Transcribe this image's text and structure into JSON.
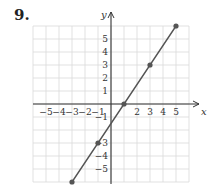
{
  "problem": {
    "number": "9."
  },
  "chart_data": {
    "type": "line",
    "title": "",
    "xlabel": "x",
    "ylabel": "y",
    "xlim": [
      -6,
      6
    ],
    "ylim": [
      -6,
      6
    ],
    "grid": true,
    "x_ticks": [
      -5,
      -4,
      -3,
      -2,
      -1,
      2,
      3,
      4,
      5
    ],
    "y_ticks": [
      5,
      4,
      3,
      2,
      1,
      -1,
      -3,
      -4,
      -5
    ],
    "series": [
      {
        "name": "y = (3/2)x - 3/2",
        "points": [
          [
            -3,
            -6
          ],
          [
            -1,
            -3
          ],
          [
            1,
            0
          ],
          [
            3,
            3
          ],
          [
            5,
            6
          ]
        ],
        "marked_points": [
          [
            -3,
            -6
          ],
          [
            -1,
            -3
          ],
          [
            1,
            0
          ],
          [
            3,
            3
          ],
          [
            5,
            6
          ]
        ]
      }
    ]
  },
  "colors": {
    "grid": "#d9d9d9",
    "axis": "#333333",
    "line": "#555555",
    "point": "#555555",
    "text": "#333333"
  }
}
